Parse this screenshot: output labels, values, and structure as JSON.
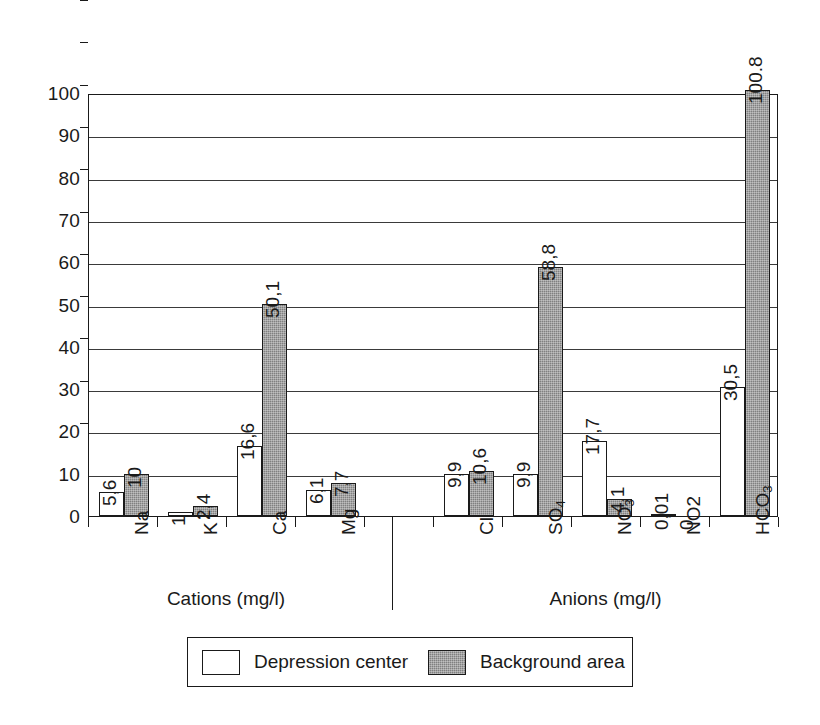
{
  "chart_data": {
    "type": "bar",
    "title": "",
    "subtitle": "",
    "xlabel": "",
    "ylabel": "",
    "ylim": [
      0,
      100
    ],
    "y_ticks": [
      0,
      10,
      20,
      30,
      40,
      50,
      60,
      70,
      80,
      90,
      100
    ],
    "grid": true,
    "legend_position": "bottom",
    "categories": [
      "Na",
      "K",
      "Ca",
      "Mg",
      "Cl",
      "SO4",
      "NO3",
      "NO2",
      "HCO3"
    ],
    "category_labels": [
      {
        "base": "Na",
        "sub": ""
      },
      {
        "base": "K",
        "sub": ""
      },
      {
        "base": "Ca",
        "sub": ""
      },
      {
        "base": "Mg",
        "sub": ""
      },
      {
        "base": "Cl",
        "sub": ""
      },
      {
        "base": "SO",
        "sub": "4"
      },
      {
        "base": "NO",
        "sub": "3"
      },
      {
        "base": "NO2",
        "sub": ""
      },
      {
        "base": "HCO",
        "sub": "3"
      }
    ],
    "series": [
      {
        "name": "Depression center",
        "color": "#ffffff",
        "values": [
          5.6,
          1,
          16.6,
          6.1,
          9.9,
          9.9,
          17.7,
          0.01,
          30.5
        ],
        "labels": [
          "5,6",
          "1",
          "16,6",
          "6,1",
          "9,9",
          "9,9",
          "17,7",
          "0,01",
          "30,5"
        ]
      },
      {
        "name": "Background area",
        "color": "#808080",
        "values": [
          10,
          2.4,
          50.1,
          7.7,
          10.6,
          58.8,
          4.1,
          0,
          100.8
        ],
        "labels": [
          "10",
          "2,4",
          "50,1",
          "7,7",
          "10,6",
          "58,8",
          "4,1",
          "0",
          "100.8"
        ]
      }
    ],
    "groups": [
      {
        "title": "Cations (mg/l)",
        "categories": [
          "Na",
          "K",
          "Ca",
          "Mg"
        ]
      },
      {
        "title": "Anions (mg/l)",
        "categories": [
          "Cl",
          "SO4",
          "NO3",
          "NO2",
          "HCO3"
        ]
      }
    ],
    "legend": [
      {
        "label": "Depression center",
        "swatch": "white-bar-swatch"
      },
      {
        "label": "Background area",
        "swatch": "gray-bar-swatch"
      }
    ]
  }
}
